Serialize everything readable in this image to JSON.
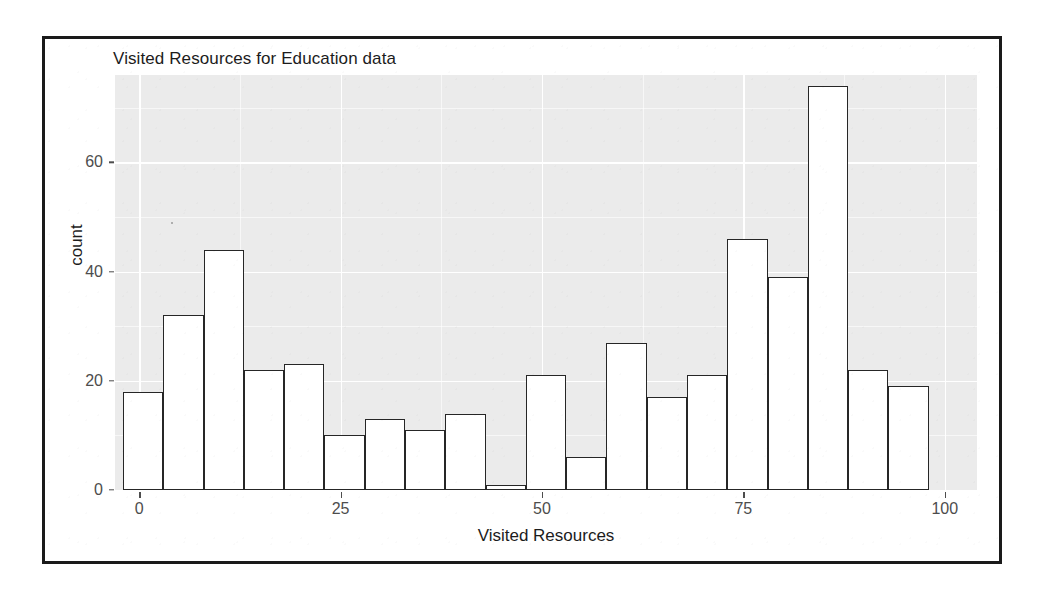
{
  "chart_data": {
    "type": "bar",
    "title": "Visited Resources for Education data",
    "xlabel": "Visited Resources",
    "ylabel": "count",
    "xlim": [
      -3,
      104
    ],
    "ylim": [
      0,
      76
    ],
    "grid": true,
    "legend": "none",
    "bin_width": 5,
    "bin_starts": [
      -2,
      3,
      8,
      13,
      18,
      23,
      28,
      33,
      38,
      43,
      48,
      53,
      58,
      63,
      68,
      73,
      78,
      83,
      88,
      93
    ],
    "categories": [
      "-2-3",
      "3-8",
      "8-13",
      "13-18",
      "18-23",
      "23-28",
      "28-33",
      "33-38",
      "38-43",
      "43-48",
      "48-53",
      "53-58",
      "58-63",
      "63-68",
      "68-73",
      "73-78",
      "78-83",
      "83-88",
      "88-93",
      "93-98"
    ],
    "values": [
      18,
      32,
      44,
      22,
      23,
      10,
      13,
      11,
      14,
      1,
      21,
      6,
      27,
      17,
      21,
      46,
      39,
      74,
      22,
      19
    ],
    "x_ticks": [
      0,
      25,
      50,
      75,
      100
    ],
    "x_tick_labels": [
      "0",
      "25",
      "50",
      "75",
      "100"
    ],
    "y_ticks": [
      0,
      20,
      40,
      60
    ],
    "y_tick_labels": [
      "0",
      "20",
      "40",
      "60"
    ],
    "y_minor_ticks": [
      10,
      30,
      50,
      70
    ],
    "x_minor_ticks": [
      12.5,
      37.5,
      62.5,
      87.5
    ]
  },
  "style": {
    "panel_background": "#ebebeb",
    "grid_color": "#ffffff",
    "bar_fill": "#ffffff",
    "bar_stroke": "#262626",
    "axis_text_color": "#4d4d4d",
    "title_color": "#1c1c1c",
    "frame_color": "#1a1a1a",
    "page_background": "#ffffff"
  }
}
